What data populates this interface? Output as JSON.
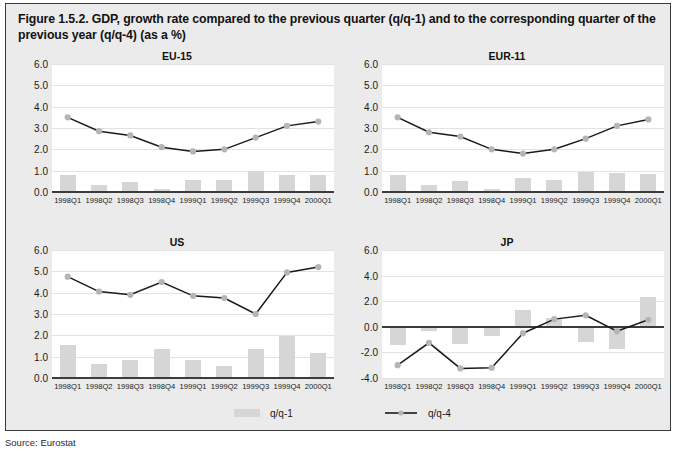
{
  "figure": {
    "title": "Figure 1.5.2. GDP, growth rate compared to the previous quarter (q/q-1) and to the corresponding quarter of the previous year (q/q-4) (as a %)",
    "source": "Source: Eurostat"
  },
  "legend": {
    "bar_label": "q/q-1",
    "line_label": "q/q-4"
  },
  "colors": {
    "panel_background": "#ebebeb",
    "plot_background": "#ffffff",
    "bar": "#d6d6d6",
    "line": "#1a1a1a",
    "marker": "#b5b5b5",
    "gridline": "#e2e2e2",
    "axis": "#3c3c3c",
    "text": "#111111"
  },
  "chart_data": [
    {
      "type": "bar",
      "title": "EU-15",
      "xlabel": "",
      "ylabel": "",
      "ylim": [
        0,
        6
      ],
      "yticks": [
        "0.0",
        "1.0",
        "2.0",
        "3.0",
        "4.0",
        "5.0",
        "6.0"
      ],
      "ytick_values": [
        0,
        1,
        2,
        3,
        4,
        5,
        6
      ],
      "grid": true,
      "legend_position": "bottom",
      "categories": [
        "1998Q1",
        "1998Q2",
        "1998Q3",
        "1998Q4",
        "1999Q1",
        "1999Q2",
        "1999Q3",
        "1999Q4",
        "2000Q1"
      ],
      "series": [
        {
          "name": "q/q-1",
          "type": "bar",
          "values": [
            0.8,
            0.35,
            0.45,
            0.15,
            0.55,
            0.55,
            1.0,
            0.8,
            0.8
          ]
        },
        {
          "name": "q/q-4",
          "type": "line",
          "values": [
            3.5,
            2.85,
            2.65,
            2.1,
            1.9,
            2.0,
            2.55,
            3.1,
            3.3
          ]
        }
      ]
    },
    {
      "type": "bar",
      "title": "EUR-11",
      "xlabel": "",
      "ylabel": "",
      "ylim": [
        0,
        6
      ],
      "yticks": [
        "0.0",
        "1.0",
        "2.0",
        "3.0",
        "4.0",
        "5.0",
        "6.0"
      ],
      "ytick_values": [
        0,
        1,
        2,
        3,
        4,
        5,
        6
      ],
      "grid": true,
      "legend_position": "bottom",
      "categories": [
        "1998Q1",
        "1998Q2",
        "1998Q3",
        "1998Q4",
        "1999Q1",
        "1999Q2",
        "1999Q3",
        "1999Q4",
        "2000Q1"
      ],
      "series": [
        {
          "name": "q/q-1",
          "type": "bar",
          "values": [
            0.8,
            0.35,
            0.5,
            0.15,
            0.65,
            0.55,
            0.95,
            0.9,
            0.85
          ]
        },
        {
          "name": "q/q-4",
          "type": "line",
          "values": [
            3.5,
            2.8,
            2.6,
            2.0,
            1.8,
            2.0,
            2.5,
            3.1,
            3.4
          ]
        }
      ]
    },
    {
      "type": "bar",
      "title": "US",
      "xlabel": "",
      "ylabel": "",
      "ylim": [
        0,
        6
      ],
      "yticks": [
        "0.0",
        "1.0",
        "2.0",
        "3.0",
        "4.0",
        "5.0",
        "6.0"
      ],
      "ytick_values": [
        0,
        1,
        2,
        3,
        4,
        5,
        6
      ],
      "grid": true,
      "legend_position": "bottom",
      "categories": [
        "1998Q1",
        "1998Q2",
        "1998Q3",
        "1998Q4",
        "1999Q1",
        "1999Q2",
        "1999Q3",
        "1999Q4",
        "2000Q1"
      ],
      "series": [
        {
          "name": "q/q-1",
          "type": "bar",
          "values": [
            1.55,
            0.65,
            0.85,
            1.35,
            0.85,
            0.55,
            1.35,
            1.95,
            1.15
          ]
        },
        {
          "name": "q/q-4",
          "type": "line",
          "values": [
            4.75,
            4.05,
            3.9,
            4.5,
            3.85,
            3.75,
            3.0,
            4.95,
            5.2
          ]
        }
      ]
    },
    {
      "type": "bar",
      "title": "JP",
      "xlabel": "",
      "ylabel": "",
      "ylim": [
        -4,
        6
      ],
      "yticks": [
        "-4.0",
        "-2.0",
        "0.0",
        "2.0",
        "4.0",
        "6.0"
      ],
      "ytick_values": [
        -4,
        -2,
        0,
        2,
        4,
        6
      ],
      "grid": true,
      "legend_position": "bottom",
      "categories": [
        "1998Q1",
        "1998Q2",
        "1998Q3",
        "1998Q4",
        "1999Q1",
        "1999Q2",
        "1999Q3",
        "1999Q4",
        "2000Q1"
      ],
      "series": [
        {
          "name": "q/q-1",
          "type": "bar",
          "values": [
            -1.4,
            -0.3,
            -1.35,
            -0.7,
            1.35,
            0.65,
            -1.15,
            -1.75,
            2.3
          ]
        },
        {
          "name": "q/q-4",
          "type": "line",
          "values": [
            -3.0,
            -1.25,
            -3.25,
            -3.2,
            -0.5,
            0.6,
            0.9,
            -0.35,
            0.55
          ]
        }
      ]
    }
  ]
}
